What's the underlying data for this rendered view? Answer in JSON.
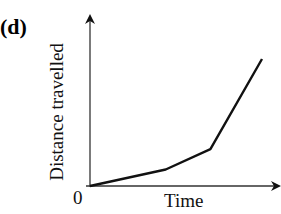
{
  "panel_label": "(d)",
  "chart_data": {
    "type": "line",
    "title": "",
    "panel": "(d)",
    "xlabel": "Time",
    "ylabel": "Distance travelled",
    "origin_label": "0",
    "x_ticks": [],
    "y_ticks": [],
    "grid": false,
    "legend": null,
    "axes_style": "arrows, no numeric scale",
    "series": [
      {
        "name": "distance",
        "x": [
          0,
          0.44,
          0.7,
          1.0
        ],
        "y": [
          0,
          0.13,
          0.29,
          1.0
        ],
        "note": "piecewise linear, increasing slope (accelerating)"
      }
    ],
    "xlim": [
      0,
      1.1
    ],
    "ylim": [
      0,
      1.2
    ]
  }
}
